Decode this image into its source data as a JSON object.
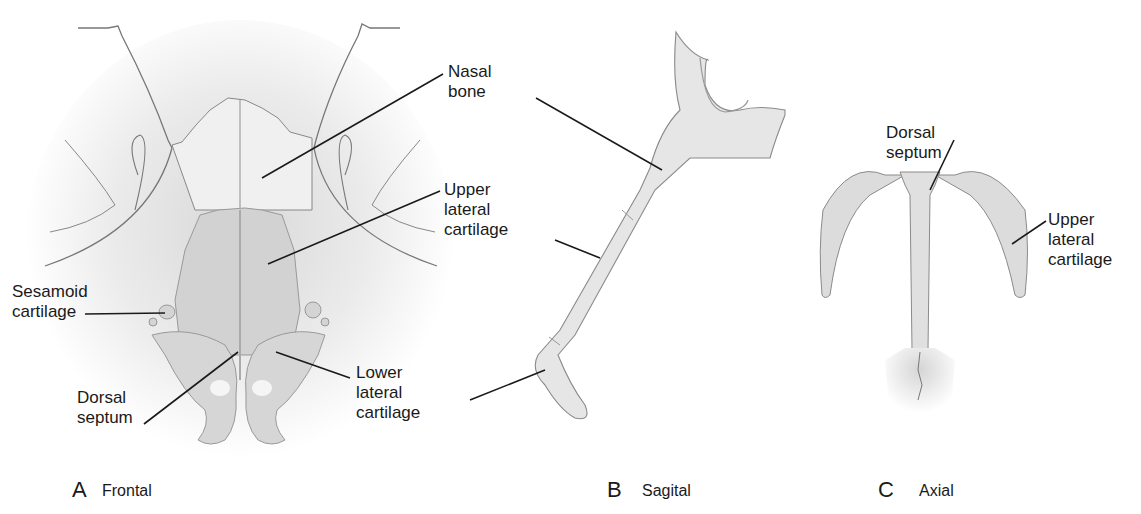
{
  "panels": [
    {
      "letter": "A",
      "name": "Frontal"
    },
    {
      "letter": "B",
      "name": "Sagital"
    },
    {
      "letter": "C",
      "name": "Axial"
    }
  ],
  "frontal_labels": {
    "nasal_bone": "Nasal\nbone",
    "upper_lateral_cartilage": "Upper\nlateral\ncartilage",
    "sesamoid_cartilage": "Sesamoid\ncartilage",
    "dorsal_septum": "Dorsal\nseptum",
    "lower_lateral_cartilage": "Lower\nlateral\ncartilage"
  },
  "axial_labels": {
    "dorsal_septum": "Dorsal\nseptum",
    "upper_lateral_cartilage": "Upper\nlateral\ncartilage"
  },
  "colors": {
    "cartilage_fill": "#dcdcdc",
    "bone_fill": "#e8e8e8",
    "outline": "#8a8a8a",
    "leader": "#1a1a1a"
  }
}
